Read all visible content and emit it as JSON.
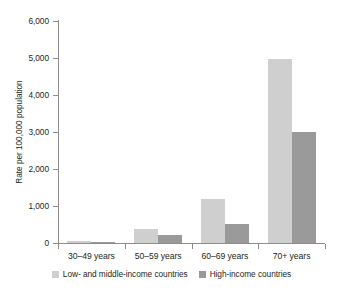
{
  "chart_data": {
    "type": "bar",
    "title": "",
    "subtitle": "",
    "xlabel": "",
    "ylabel": "Rate per 100,000 population",
    "categories": [
      "30–49 years",
      "50–59 years",
      "60–69 years",
      "70+ years"
    ],
    "series": [
      {
        "name": "Low- and middle-income countries",
        "color": "#cfcfcf",
        "values": [
          50,
          370,
          1200,
          4980
        ]
      },
      {
        "name": "High-income countries",
        "color": "#9a9a9a",
        "values": [
          25,
          210,
          510,
          3010
        ]
      }
    ],
    "ylim": [
      0,
      6000
    ],
    "yticks": [
      0,
      1000,
      2000,
      3000,
      4000,
      5000,
      6000
    ],
    "ytick_labels": [
      "0",
      "1,000",
      "2,000",
      "3,000",
      "4,000",
      "5,000",
      "6,000"
    ],
    "grid": false,
    "legend_position": "bottom",
    "axis_color": "#8d8d8d",
    "background": "#ffffff"
  },
  "legend": {
    "items": [
      {
        "label": "Low- and middle-income countries"
      },
      {
        "label": "High-income countries"
      }
    ]
  }
}
